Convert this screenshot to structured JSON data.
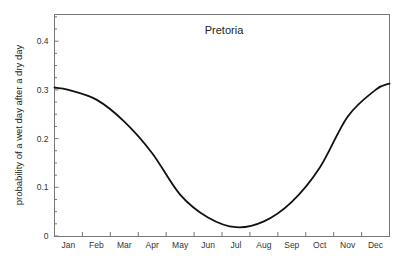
{
  "chart_data": {
    "type": "line",
    "title": "Pretoria",
    "xlabel": "",
    "ylabel": "probability of a wet day after a dry day",
    "categories": [
      "Jan",
      "Feb",
      "Mar",
      "Apr",
      "May",
      "Jun",
      "Jul",
      "Aug",
      "Sep",
      "Oct",
      "Nov",
      "Dec"
    ],
    "ylim": [
      0,
      0.45
    ],
    "yticks": [
      0,
      0.1,
      0.2,
      0.3,
      0.4
    ],
    "ytick_labels": [
      "0",
      "0.1",
      "0.2",
      "0.3",
      "0.4"
    ],
    "grid": false,
    "legend": "none",
    "series": [
      {
        "name": "Pretoria",
        "x": [
          0,
          0.5,
          1.5,
          2.5,
          3.5,
          4.5,
          5.5,
          6.5,
          7.5,
          8.5,
          9.5,
          10.5,
          11.5,
          12
        ],
        "values": [
          0.305,
          0.3,
          0.28,
          0.235,
          0.17,
          0.085,
          0.038,
          0.018,
          0.03,
          0.07,
          0.14,
          0.245,
          0.3,
          0.313
        ]
      }
    ]
  }
}
